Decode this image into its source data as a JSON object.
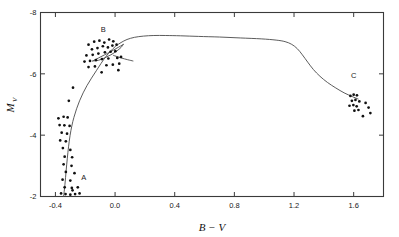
{
  "figure": {
    "kind": "scatter-with-curve",
    "background": "#ffffff",
    "ink_color": "#1a1a1a"
  },
  "chart_data": {
    "type": "scatter",
    "title": "",
    "subtitle": "",
    "xlabel": "B − V",
    "ylabel": "M",
    "ylabel_subscript": "V",
    "xlim": [
      -0.5,
      1.8
    ],
    "ylim": [
      -8,
      -2
    ],
    "y_inverted": true,
    "grid": false,
    "legend": "none",
    "xticks": [
      -0.4,
      0.0,
      0.4,
      0.8,
      1.2,
      1.6
    ],
    "xticklabels": [
      "-0.4",
      "0.0",
      "0.4",
      "0.8",
      "1.2",
      "1.6"
    ],
    "yticks": [
      -8,
      -6,
      -4,
      -2
    ],
    "yticklabels": [
      "-8",
      "-6",
      "-4",
      "-2"
    ],
    "annotations": [
      {
        "text": "A",
        "x": -0.21,
        "y": -2.55
      },
      {
        "text": "B",
        "x": -0.08,
        "y": -7.35
      },
      {
        "text": "C",
        "x": 1.6,
        "y": -5.85
      }
    ],
    "series": [
      {
        "name": "Cluster A",
        "marker": "point",
        "points": [
          [
            -0.38,
            -4.55
          ],
          [
            -0.345,
            -4.6
          ],
          [
            -0.318,
            -4.58
          ],
          [
            -0.372,
            -4.33
          ],
          [
            -0.34,
            -4.32
          ],
          [
            -0.305,
            -4.3
          ],
          [
            -0.358,
            -4.08
          ],
          [
            -0.322,
            -4.05
          ],
          [
            -0.368,
            -3.83
          ],
          [
            -0.33,
            -3.8
          ],
          [
            -0.35,
            -3.58
          ],
          [
            -0.3,
            -3.52
          ],
          [
            -0.338,
            -3.3
          ],
          [
            -0.288,
            -3.28
          ],
          [
            -0.345,
            -3.05
          ],
          [
            -0.292,
            -3.0
          ],
          [
            -0.33,
            -2.8
          ],
          [
            -0.272,
            -2.76
          ],
          [
            -0.352,
            -2.55
          ],
          [
            -0.3,
            -2.52
          ],
          [
            -0.338,
            -2.3
          ],
          [
            -0.29,
            -2.28
          ],
          [
            -0.25,
            -2.3
          ],
          [
            -0.362,
            -2.1
          ],
          [
            -0.332,
            -2.08
          ],
          [
            -0.3,
            -2.06
          ],
          [
            -0.268,
            -2.08
          ],
          [
            -0.238,
            -2.1
          ],
          [
            -0.285,
            -2.2
          ],
          [
            -0.31,
            -5.12
          ],
          [
            -0.282,
            -5.55
          ]
        ]
      },
      {
        "name": "Cluster B",
        "marker": "point",
        "points": [
          [
            -0.178,
            -6.95
          ],
          [
            -0.14,
            -7.05
          ],
          [
            -0.105,
            -7.08
          ],
          [
            -0.072,
            -7.02
          ],
          [
            -0.04,
            -7.12
          ],
          [
            -0.012,
            -7.06
          ],
          [
            -0.155,
            -6.8
          ],
          [
            -0.118,
            -6.84
          ],
          [
            -0.082,
            -6.9
          ],
          [
            -0.048,
            -6.86
          ],
          [
            -0.018,
            -6.92
          ],
          [
            0.01,
            -6.95
          ],
          [
            -0.192,
            -6.6
          ],
          [
            -0.15,
            -6.62
          ],
          [
            -0.112,
            -6.66
          ],
          [
            -0.068,
            -6.7
          ],
          [
            -0.03,
            -6.72
          ],
          [
            0.002,
            -6.74
          ],
          [
            -0.205,
            -6.4
          ],
          [
            -0.168,
            -6.42
          ],
          [
            -0.128,
            -6.45
          ],
          [
            -0.088,
            -6.48
          ],
          [
            -0.045,
            -6.5
          ],
          [
            0.015,
            -6.52
          ],
          [
            -0.178,
            -6.22
          ],
          [
            -0.135,
            -6.24
          ],
          [
            -0.058,
            -6.28
          ],
          [
            -0.015,
            -6.3
          ],
          [
            0.028,
            -6.33
          ],
          [
            -0.09,
            -6.05
          ],
          [
            0.022,
            -6.12
          ],
          [
            0.04,
            -6.55
          ]
        ]
      },
      {
        "name": "Cluster C",
        "marker": "point",
        "points": [
          [
            1.578,
            -5.28
          ],
          [
            1.6,
            -5.32
          ],
          [
            1.622,
            -5.3
          ],
          [
            1.588,
            -5.12
          ],
          [
            1.612,
            -5.15
          ],
          [
            1.638,
            -5.1
          ],
          [
            1.572,
            -4.96
          ],
          [
            1.598,
            -4.98
          ],
          [
            1.62,
            -4.94
          ],
          [
            1.605,
            -4.8
          ],
          [
            1.632,
            -4.82
          ],
          [
            1.68,
            -5.05
          ],
          [
            1.7,
            -4.9
          ],
          [
            1.662,
            -4.62
          ],
          [
            1.712,
            -4.72
          ]
        ]
      },
      {
        "name": "Evolutionary track",
        "marker": "line",
        "points": [
          [
            -0.345,
            -2.0
          ],
          [
            -0.336,
            -2.4
          ],
          [
            -0.328,
            -2.85
          ],
          [
            -0.32,
            -3.25
          ],
          [
            -0.312,
            -3.62
          ],
          [
            -0.302,
            -3.98
          ],
          [
            -0.29,
            -4.3
          ],
          [
            -0.276,
            -4.58
          ],
          [
            -0.258,
            -4.86
          ],
          [
            -0.238,
            -5.12
          ],
          [
            -0.214,
            -5.38
          ],
          [
            -0.188,
            -5.62
          ],
          [
            -0.158,
            -5.86
          ],
          [
            -0.126,
            -6.1
          ],
          [
            -0.094,
            -6.34
          ],
          [
            -0.062,
            -6.56
          ],
          [
            -0.03,
            -6.74
          ],
          [
            0.004,
            -6.9
          ],
          [
            0.04,
            -7.02
          ],
          [
            0.08,
            -7.12
          ],
          [
            0.13,
            -7.19
          ],
          [
            0.19,
            -7.23
          ],
          [
            0.26,
            -7.25
          ],
          [
            0.34,
            -7.25
          ],
          [
            0.44,
            -7.24
          ],
          [
            0.56,
            -7.22
          ],
          [
            0.7,
            -7.2
          ],
          [
            0.84,
            -7.17
          ],
          [
            0.98,
            -7.14
          ],
          [
            1.08,
            -7.1
          ],
          [
            1.14,
            -7.05
          ],
          [
            1.185,
            -6.96
          ],
          [
            1.222,
            -6.82
          ],
          [
            1.256,
            -6.62
          ],
          [
            1.292,
            -6.38
          ],
          [
            1.33,
            -6.14
          ],
          [
            1.374,
            -5.92
          ],
          [
            1.424,
            -5.72
          ],
          [
            1.48,
            -5.54
          ],
          [
            1.536,
            -5.38
          ],
          [
            1.59,
            -5.26
          ],
          [
            1.63,
            -5.18
          ]
        ]
      },
      {
        "name": "Blue loop upper",
        "marker": "line",
        "points": [
          [
            -0.15,
            -6.42
          ],
          [
            -0.11,
            -6.52
          ],
          [
            -0.07,
            -6.62
          ],
          [
            -0.03,
            -6.72
          ],
          [
            0.005,
            -6.82
          ],
          [
            0.035,
            -6.9
          ],
          [
            0.055,
            -6.96
          ]
        ]
      },
      {
        "name": "Blue loop lower",
        "marker": "line",
        "points": [
          [
            0.055,
            -6.96
          ],
          [
            0.04,
            -6.86
          ],
          [
            0.01,
            -6.74
          ],
          [
            -0.028,
            -6.62
          ],
          [
            -0.07,
            -6.52
          ],
          [
            -0.112,
            -6.44
          ],
          [
            -0.15,
            -6.42
          ]
        ]
      },
      {
        "name": "Blue loop tail",
        "marker": "line",
        "points": [
          [
            -0.01,
            -6.6
          ],
          [
            0.04,
            -6.52
          ],
          [
            0.085,
            -6.46
          ],
          [
            0.12,
            -6.42
          ]
        ]
      }
    ]
  }
}
